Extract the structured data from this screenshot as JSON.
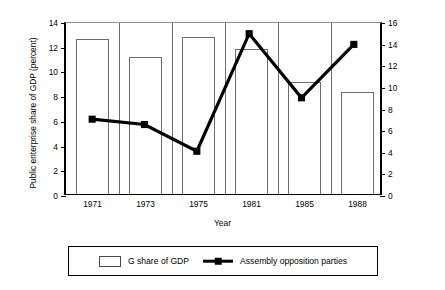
{
  "chart_data": {
    "type": "bar",
    "title": "",
    "categories": [
      "1971",
      "1973",
      "1975",
      "1981",
      "1985",
      "1988"
    ],
    "xlabel": "Year",
    "ylabel": "Public enterprise share of GDP (percent)",
    "ylabel_right": "Number of political parties",
    "ylim": [
      0,
      14
    ],
    "ylim_right": [
      0,
      16
    ],
    "yticks": [
      0,
      2,
      4,
      6,
      8,
      10,
      12,
      14
    ],
    "yticks_right": [
      0,
      2,
      4,
      6,
      8,
      10,
      12,
      14,
      16
    ],
    "grid": false,
    "legend_position": "bottom",
    "series": [
      {
        "name": "G share of GDP",
        "type": "bar",
        "axis": "left",
        "values": [
          12.55,
          11.1,
          12.7,
          11.7,
          9.1,
          8.25
        ]
      },
      {
        "name": "Assembly opposition parties",
        "type": "line",
        "axis": "right",
        "marker": "square",
        "values": [
          7,
          6.5,
          4,
          15,
          9,
          14
        ]
      }
    ]
  },
  "legend": {
    "items": [
      {
        "label": "G share of GDP",
        "swatch": "bar-outline"
      },
      {
        "label": "Assembly opposition parties",
        "swatch": "line-square-marker"
      }
    ]
  },
  "axes": {
    "left_title": "Public enterprise share of GDP (percent)",
    "right_title": "Number of political parties",
    "x_title": "Year",
    "left_ticks": [
      "0",
      "2",
      "4",
      "6",
      "8",
      "10",
      "12",
      "14"
    ],
    "right_ticks": [
      "0",
      "2",
      "4",
      "6",
      "8",
      "10",
      "12",
      "14",
      "16"
    ],
    "x_ticks": [
      "1971",
      "1973",
      "1975",
      "1981",
      "1985",
      "1988"
    ]
  },
  "colors": {
    "line": "#000000",
    "bar_stroke": "#6e6e6e",
    "bar_fill": "#ffffff",
    "axis": "#000000",
    "background": "#ffffff"
  }
}
